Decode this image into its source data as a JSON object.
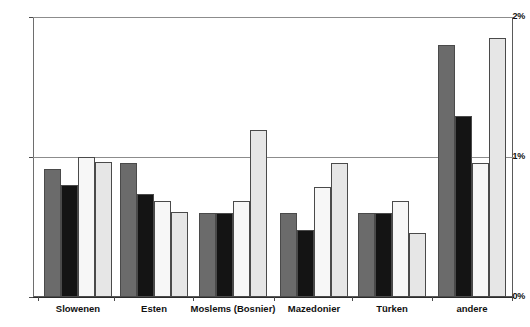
{
  "chart_data": {
    "type": "bar",
    "title": "",
    "subtitle": "",
    "xlabel": "",
    "ylabel": "",
    "ylim": [
      0,
      2
    ],
    "ytick_labels": [
      "0%",
      "1%",
      "2%"
    ],
    "ytick_values": [
      0,
      1,
      2
    ],
    "grid": true,
    "legend_position": "none",
    "categories": [
      "Slowenen",
      "Esten",
      "Moslems (Bosnier)",
      "Mazedonier",
      "Türken",
      "andere"
    ],
    "series": [
      {
        "name": "series-1",
        "color": "#6b6b6b",
        "values": [
          0.92,
          0.96,
          0.6,
          0.6,
          0.6,
          1.81
        ]
      },
      {
        "name": "series-2",
        "color": "#141414",
        "values": [
          0.8,
          0.74,
          0.6,
          0.48,
          0.6,
          1.3
        ]
      },
      {
        "name": "series-3",
        "color": "#f7f7f7",
        "values": [
          1.0,
          0.69,
          0.69,
          0.79,
          0.69,
          0.96
        ]
      },
      {
        "name": "series-4",
        "color": "#e6e6e6",
        "values": [
          0.97,
          0.61,
          1.2,
          0.96,
          0.46,
          1.86
        ]
      }
    ]
  }
}
